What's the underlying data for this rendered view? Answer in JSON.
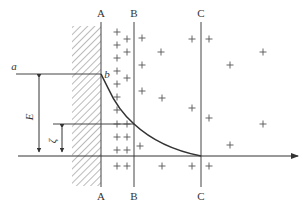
{
  "diagram": {
    "title": "",
    "colors": {
      "line": "#444444",
      "curve": "#333333",
      "hatch": "#666666",
      "plus": "#555555"
    },
    "labels": {
      "plane_A_top": "A",
      "plane_B_top": "B",
      "plane_C_top": "C",
      "plane_A_bottom": "A",
      "plane_B_bottom": "B",
      "plane_C_bottom": "C",
      "point_a": "a",
      "point_b": "b",
      "potential_E": "E",
      "zeta_potential": "ζ"
    },
    "regions": {
      "wall": "hatched solid surface (left)",
      "stern_layer": "between A and B",
      "diffuse_layer": "between B and C",
      "bulk_solution": "right of C"
    },
    "positive_ions": [
      {
        "x": 117,
        "y": 32
      },
      {
        "x": 127,
        "y": 39
      },
      {
        "x": 142,
        "y": 38
      },
      {
        "x": 117,
        "y": 45
      },
      {
        "x": 127,
        "y": 52
      },
      {
        "x": 142,
        "y": 65
      },
      {
        "x": 161,
        "y": 52
      },
      {
        "x": 117,
        "y": 58
      },
      {
        "x": 127,
        "y": 78
      },
      {
        "x": 117,
        "y": 71
      },
      {
        "x": 117,
        "y": 84
      },
      {
        "x": 142,
        "y": 91
      },
      {
        "x": 117,
        "y": 97
      },
      {
        "x": 117,
        "y": 110
      },
      {
        "x": 117,
        "y": 124
      },
      {
        "x": 127,
        "y": 124
      },
      {
        "x": 117,
        "y": 137
      },
      {
        "x": 127,
        "y": 137
      },
      {
        "x": 140,
        "y": 146
      },
      {
        "x": 117,
        "y": 150
      },
      {
        "x": 127,
        "y": 150
      },
      {
        "x": 117,
        "y": 166
      },
      {
        "x": 127,
        "y": 166
      },
      {
        "x": 162,
        "y": 166
      },
      {
        "x": 192,
        "y": 166
      },
      {
        "x": 209,
        "y": 166
      },
      {
        "x": 192,
        "y": 39
      },
      {
        "x": 209,
        "y": 39
      },
      {
        "x": 162,
        "y": 98
      },
      {
        "x": 192,
        "y": 108
      },
      {
        "x": 263,
        "y": 52
      },
      {
        "x": 230,
        "y": 65
      },
      {
        "x": 209,
        "y": 118
      },
      {
        "x": 263,
        "y": 124
      },
      {
        "x": 230,
        "y": 145
      }
    ]
  }
}
